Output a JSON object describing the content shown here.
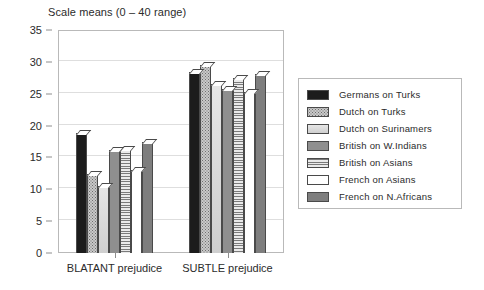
{
  "chart_data": {
    "type": "bar",
    "title": "Scale means (0 – 40 range)",
    "xlabel": "",
    "ylabel": "",
    "ylim": [
      0,
      35
    ],
    "yticks": [
      "0",
      "5",
      "10",
      "15",
      "20",
      "25",
      "30",
      "35"
    ],
    "ytick_values": [
      0,
      5,
      10,
      15,
      20,
      25,
      30,
      35
    ],
    "grid": true,
    "legend_position": "right",
    "categories": [
      "BLATANT prejudice",
      "SUBTLE prejudice"
    ],
    "series": [
      {
        "name": "Germans on Turks",
        "values": [
          18.8,
          28.4
        ],
        "pattern": "solid-black"
      },
      {
        "name": "Dutch on Turks",
        "values": [
          12.4,
          29.5
        ],
        "pattern": "dots-dark"
      },
      {
        "name": "Dutch on Surinamers",
        "values": [
          10.5,
          26.5
        ],
        "pattern": "light-gray"
      },
      {
        "name": "British on W.Indians",
        "values": [
          16.2,
          25.8
        ],
        "pattern": "medium-gray"
      },
      {
        "name": "British on Asians",
        "values": [
          16.3,
          27.4
        ],
        "pattern": "hlines"
      },
      {
        "name": "French on Asians",
        "values": [
          13.1,
          25.2
        ],
        "pattern": "white"
      },
      {
        "name": "French on N.Africans",
        "values": [
          17.5,
          28.1
        ],
        "pattern": "dark-gray"
      }
    ]
  },
  "legend": {
    "items": [
      {
        "label": "Germans on Turks"
      },
      {
        "label": "Dutch on Turks"
      },
      {
        "label": "Dutch on Surinamers"
      },
      {
        "label": "British on W.Indians"
      },
      {
        "label": "British on Asians"
      },
      {
        "label": "French on Asians"
      },
      {
        "label": "French on N.Africans"
      }
    ]
  },
  "colors": {
    "axis": "#8d8d8d",
    "grid": "#dedede",
    "frame": "#b9b9b9",
    "bar_outline": "#4a4a4a",
    "text": "#2b2b2b",
    "background": "#ffffff"
  }
}
